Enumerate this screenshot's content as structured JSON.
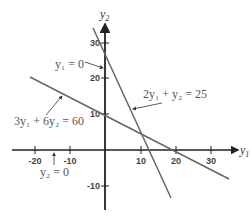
{
  "axes": {
    "x_label": "y",
    "x_label_sub": "1",
    "y_label": "y",
    "y_label_sub": "2",
    "x_ticks": [
      {
        "value": -20,
        "label": "-20"
      },
      {
        "value": -10,
        "label": "-10"
      },
      {
        "value": 10,
        "label": "10"
      },
      {
        "value": 20,
        "label": "20"
      },
      {
        "value": 30,
        "label": "30"
      }
    ],
    "y_ticks": [
      {
        "value": 30,
        "label": "30"
      },
      {
        "value": 20,
        "label": "20"
      },
      {
        "value": 10,
        "label": "10"
      },
      {
        "value": -10,
        "label": "-10"
      }
    ]
  },
  "lines": [
    {
      "equation": "2y1 + y2 = 25",
      "label": "2y₁ + y₂ = 25"
    },
    {
      "equation": "3y1 + 6y2 = 60",
      "label": "3y₁ + 6y₂ = 60"
    }
  ],
  "annotations": [
    {
      "label": "y₁ = 0",
      "target": "y2-axis"
    },
    {
      "label": "y₂ = 0",
      "target": "y1-axis"
    }
  ],
  "colors": {
    "axis": "#222222",
    "line": "#555555",
    "text": "#555555"
  }
}
